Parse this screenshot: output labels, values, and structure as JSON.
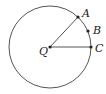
{
  "diagram": {
    "type": "circle-geometry",
    "circle": {
      "center": "Q",
      "cx": 50,
      "cy": 47,
      "r": 41,
      "stroke": "#555555"
    },
    "points": [
      {
        "id": "A",
        "label": "A",
        "x": 78,
        "y": 17,
        "lx": 82,
        "ly": 17
      },
      {
        "id": "B",
        "label": "B",
        "x": 88,
        "y": 31,
        "lx": 93,
        "ly": 34
      },
      {
        "id": "C",
        "label": "C",
        "x": 91,
        "y": 47,
        "lx": 95,
        "ly": 52
      },
      {
        "id": "Q",
        "label": "Q",
        "x": 50,
        "y": 47,
        "lx": 39,
        "ly": 55
      }
    ],
    "segments": [
      {
        "from": "Q",
        "to": "A"
      },
      {
        "from": "Q",
        "to": "C"
      }
    ]
  }
}
